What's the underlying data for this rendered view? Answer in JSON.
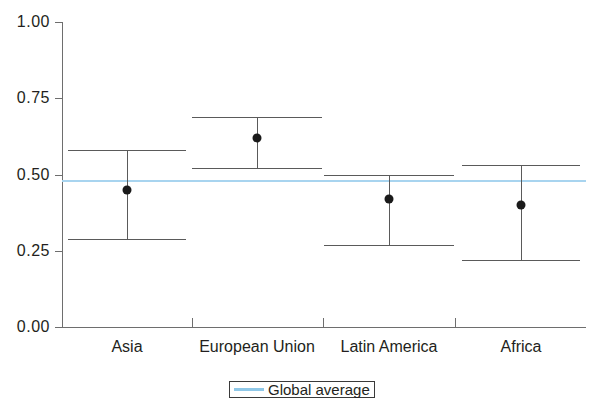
{
  "chart_data": {
    "type": "scatter",
    "title": "",
    "subtitle": "",
    "xlabel": "",
    "ylabel": "",
    "categories": [
      "Asia",
      "European Union",
      "Latin America",
      "Africa"
    ],
    "values": [
      0.45,
      0.62,
      0.42,
      0.4
    ],
    "error_upper": [
      0.58,
      0.69,
      0.5,
      0.53
    ],
    "error_lower": [
      0.29,
      0.52,
      0.27,
      0.22
    ],
    "series": [
      {
        "name": "Estimate",
        "points": [
          {
            "category": "Asia",
            "value": 0.45,
            "upper": 0.58,
            "lower": 0.29
          },
          {
            "category": "European Union",
            "value": 0.62,
            "upper": 0.69,
            "lower": 0.52
          },
          {
            "category": "Latin America",
            "value": 0.42,
            "upper": 0.5,
            "lower": 0.27
          },
          {
            "category": "Africa",
            "value": 0.4,
            "upper": 0.53,
            "lower": 0.22
          }
        ]
      }
    ],
    "reference_lines": [
      {
        "name": "Global average",
        "value": 0.48,
        "color": "#a8d4ef"
      }
    ],
    "ylim": [
      0.0,
      1.0
    ],
    "yticks": [
      0.0,
      0.25,
      0.5,
      0.75,
      1.0
    ],
    "ytick_labels": [
      "0.00",
      "0.25",
      "0.50",
      "0.75",
      "1.00"
    ],
    "grid": false,
    "legend_position": "bottom-center",
    "legend_entries": [
      "Global average"
    ],
    "marker_color": "#1a1a1a",
    "errorbar_color": "#5a5a5a"
  },
  "axis": {
    "y_tick_labels": [
      "1.00",
      "0.75",
      "0.50",
      "0.25",
      "0.00"
    ],
    "x_tick_labels": [
      "Asia",
      "European Union",
      "Latin America",
      "Africa"
    ]
  },
  "legend": {
    "label": "Global average"
  }
}
